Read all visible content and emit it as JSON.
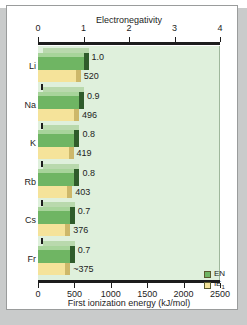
{
  "chart_data": {
    "type": "bar",
    "orientation": "horizontal",
    "title": "",
    "categories": [
      "Li",
      "Na",
      "K",
      "Rb",
      "Cs",
      "Fr"
    ],
    "series": [
      {
        "name": "EN",
        "axis": "top",
        "values": [
          1.0,
          0.9,
          0.8,
          0.8,
          0.7,
          0.7
        ],
        "labels": [
          "1.0",
          "0.9",
          "0.8",
          "0.8",
          "0.7",
          "0.7"
        ],
        "color": "#6fb563"
      },
      {
        "name": "IE1",
        "axis": "bottom",
        "values": [
          520,
          496,
          419,
          403,
          376,
          375
        ],
        "labels": [
          "520",
          "496",
          "419",
          "403",
          "376",
          "~375"
        ],
        "color": "#f5e39a"
      }
    ],
    "top_axis": {
      "label": "Electronegativity",
      "ticks": [
        "0",
        "1",
        "2",
        "3",
        "4"
      ],
      "range": [
        0,
        4
      ]
    },
    "bottom_axis": {
      "label": "First ionization energy (kJ/mol)",
      "ticks": [
        "0",
        "500",
        "1000",
        "1500",
        "2000",
        "2500"
      ],
      "range": [
        0,
        2500
      ]
    },
    "legend": {
      "position": "bottom-right",
      "entries": [
        {
          "label": "EN",
          "color": "#6fb563"
        },
        {
          "label": "IE",
          "sub": "1",
          "color": "#f5e39a"
        }
      ]
    },
    "grid": false,
    "plot_background": "#dff0dc"
  }
}
